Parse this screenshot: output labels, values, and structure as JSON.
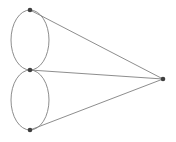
{
  "diagram": {
    "type": "graph",
    "colors": {
      "edge": "#808080",
      "node": "#404040",
      "background": "#ffffff"
    },
    "nodes": [
      {
        "id": "n1",
        "x": 30,
        "y": 10
      },
      {
        "id": "n2",
        "x": 30,
        "y": 70
      },
      {
        "id": "n3",
        "x": 30,
        "y": 130
      },
      {
        "id": "n4",
        "x": 163,
        "y": 79
      }
    ],
    "edges": [
      {
        "from": "n1",
        "to": "n2",
        "kind": "curved-pair"
      },
      {
        "from": "n2",
        "to": "n3",
        "kind": "curved-pair"
      },
      {
        "from": "n1",
        "to": "n4",
        "kind": "straight"
      },
      {
        "from": "n2",
        "to": "n4",
        "kind": "straight"
      },
      {
        "from": "n3",
        "to": "n4",
        "kind": "straight"
      }
    ]
  }
}
